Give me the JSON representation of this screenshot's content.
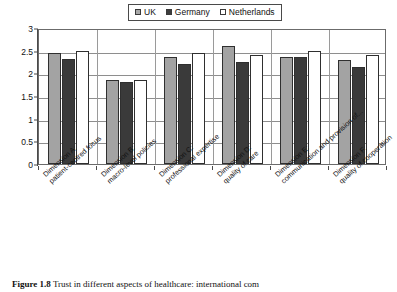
{
  "legend": {
    "position": "top-center",
    "items": [
      {
        "label": "UK",
        "swatch": "legend-swatch-uk",
        "color": "#a3a3a3"
      },
      {
        "label": "Germany",
        "swatch": "legend-swatch-germany",
        "color": "#3a3a3a"
      },
      {
        "label": "Netherlands",
        "swatch": "legend-swatch-netherlands",
        "color": "#ffffff"
      }
    ]
  },
  "caption": {
    "figure_number": "Figure 1.8",
    "text": "Trust in different aspects of healthcare: international com"
  },
  "chart_data": {
    "type": "bar",
    "title": "",
    "xlabel": "",
    "ylabel": "",
    "ylim": [
      0,
      3
    ],
    "yticks": [
      "0",
      "0.5",
      "1",
      "1.5",
      "2",
      "2.5",
      "3"
    ],
    "ytick_values": [
      0,
      0.5,
      1,
      1.5,
      2,
      2.5,
      3
    ],
    "grid": true,
    "legend_position": "top-center",
    "categories": [
      "Dimension A: patient-centred focus",
      "Dimension B: macro-level policies",
      "Dimension C: professional expertise",
      "Dimension D: quality of care",
      "Dimension E: communication and provision of...",
      "Dimension F: quality of cooperation"
    ],
    "category_lines": [
      [
        "Dimension A:",
        "patient-centred focus"
      ],
      [
        "Dimension B:",
        "macro-level policies"
      ],
      [
        "Dimension C:",
        "professional expertise"
      ],
      [
        "Dimension D:",
        "quality of care"
      ],
      [
        "Dimension E:",
        "communication and provision of..."
      ],
      [
        "Dimension F:",
        "quality of cooperation"
      ]
    ],
    "series": [
      {
        "name": "UK",
        "color": "#a3a3a3",
        "values": [
          2.45,
          1.85,
          2.35,
          2.6,
          2.35,
          2.3
        ]
      },
      {
        "name": "Germany",
        "color": "#3a3a3a",
        "values": [
          2.32,
          1.82,
          2.2,
          2.25,
          2.35,
          2.15
        ]
      },
      {
        "name": "Netherlands",
        "color": "#ffffff",
        "values": [
          2.5,
          1.85,
          2.45,
          2.4,
          2.5,
          2.4
        ]
      }
    ]
  }
}
